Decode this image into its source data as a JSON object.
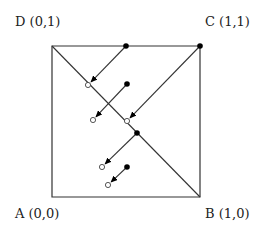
{
  "labels": {
    "D": "D (0,1)",
    "C": "C (1,1)",
    "A": "A (0,0)",
    "B": "B (1,0)"
  },
  "colors": {
    "stroke": "#333333",
    "filled": "#000000",
    "open_fill": "#ffffff"
  },
  "square": {
    "A": [
      52,
      197
    ],
    "B": [
      200,
      197
    ],
    "C": [
      200,
      46
    ],
    "D": [
      52,
      46
    ]
  },
  "diagonal": {
    "from": "D",
    "to": "B"
  },
  "arrows": [
    {
      "from": [
        200,
        46
      ],
      "to": [
        127,
        121
      ],
      "start_point": "filled",
      "end_point": "open"
    },
    {
      "from": [
        126,
        46
      ],
      "to": [
        88,
        85
      ],
      "start_point": "filled",
      "end_point": "open"
    },
    {
      "from": [
        127,
        84
      ],
      "to": [
        93,
        120
      ],
      "start_point": "filled",
      "end_point": "open"
    },
    {
      "from": [
        137,
        133
      ],
      "to": [
        102,
        167
      ],
      "start_point": "filled",
      "end_point": "open"
    },
    {
      "from": [
        127,
        167
      ],
      "to": [
        108,
        185
      ],
      "start_point": "filled",
      "end_point": "open"
    }
  ]
}
